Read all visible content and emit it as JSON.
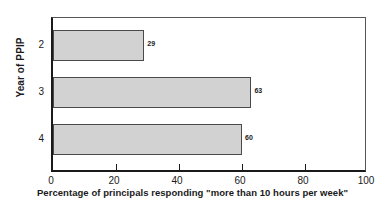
{
  "chart_data": {
    "type": "bar",
    "orientation": "horizontal",
    "title": "",
    "xlabel": "Percentage of principals responding \"more than 10 hours per week\"",
    "ylabel": "Year of PPIP",
    "categories": [
      "2",
      "3",
      "4"
    ],
    "values": [
      29,
      63,
      60
    ],
    "data_labels": [
      "29",
      "63",
      "60"
    ],
    "xlim": [
      0,
      100
    ],
    "xticks": [
      0,
      20,
      40,
      60,
      80,
      100
    ],
    "xtick_labels": [
      "0",
      "20",
      "40",
      "60",
      "80",
      "100"
    ],
    "grid": false,
    "legend": null,
    "bar_fill_color": "#d2d2d2",
    "bar_edge_color": "#4a4a4a",
    "axis_color": "#1a1a1a"
  }
}
